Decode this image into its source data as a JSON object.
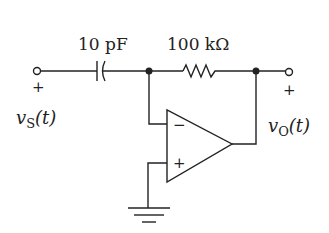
{
  "diagram": {
    "type": "circuit-schematic",
    "components": {
      "capacitor": {
        "label": "10 pF"
      },
      "resistor": {
        "label": "100 kΩ"
      },
      "opamp": {
        "inverting_symbol": "−",
        "noninverting_symbol": "+"
      },
      "ground": {}
    },
    "input": {
      "symbol": "v",
      "subscript": "S",
      "suffix": "(t)",
      "polarity": "+"
    },
    "output": {
      "symbol": "v",
      "subscript": "O",
      "suffix": "(t)",
      "polarity": "+"
    },
    "colors": {
      "stroke": "#222222",
      "background": "#ffffff"
    }
  }
}
